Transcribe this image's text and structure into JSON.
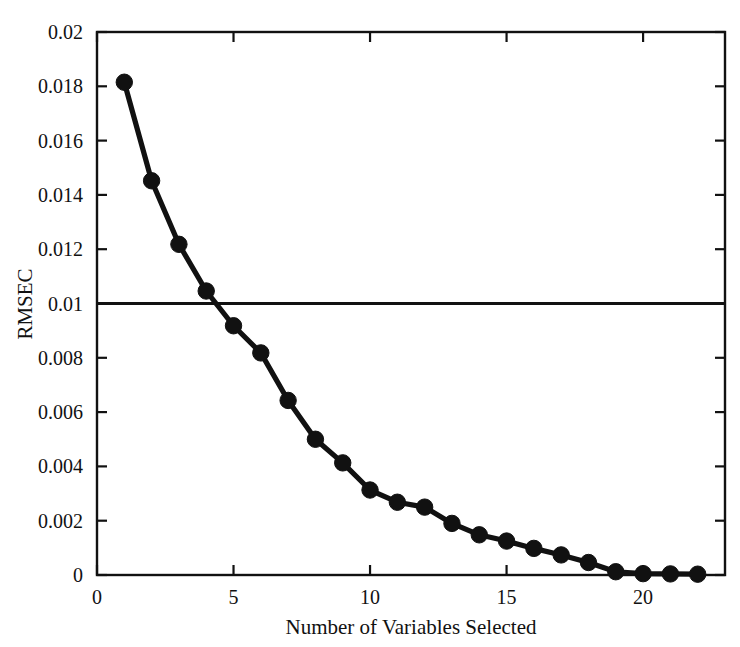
{
  "chart_data": {
    "type": "line",
    "title": "",
    "xlabel": "Number of Variables Selected",
    "ylabel": "RMSEC",
    "xlim": [
      0,
      23
    ],
    "ylim": [
      0,
      0.02
    ],
    "grid": false,
    "legend": "none",
    "x_ticks": [
      0,
      5,
      10,
      15,
      20
    ],
    "x_tick_labels": [
      "0",
      "5",
      "10",
      "15",
      "20"
    ],
    "y_ticks": [
      0,
      0.002,
      0.004,
      0.006,
      0.008,
      0.01,
      0.012,
      0.014,
      0.016,
      0.018,
      0.02
    ],
    "y_tick_labels": [
      "0",
      "0.002",
      "0.004",
      "0.006",
      "0.008",
      "0.01",
      "0.012",
      "0.014",
      "0.016",
      "0.018",
      "0.02"
    ],
    "x": [
      1,
      2,
      3,
      4,
      5,
      6,
      7,
      8,
      9,
      10,
      11,
      12,
      13,
      14,
      15,
      16,
      17,
      18,
      19,
      20,
      21,
      22
    ],
    "series": [
      {
        "name": "RMSEC",
        "marker": "filled-circle",
        "color": "#111111",
        "values": [
          0.01815,
          0.01452,
          0.01218,
          0.01046,
          0.00918,
          0.00818,
          0.00643,
          0.005,
          0.00413,
          0.00313,
          0.00268,
          0.0025,
          0.0019,
          0.00148,
          0.00125,
          0.00098,
          0.00074,
          0.00046,
          0.00012,
          5e-05,
          4e-05,
          3e-05
        ]
      }
    ],
    "annotations": [
      {
        "name": "threshold-line",
        "type": "horizontal-line",
        "y": 0.01,
        "color": "#111111"
      }
    ]
  },
  "figure": {
    "background_color": "#ffffff",
    "axis_color": "#111111"
  }
}
